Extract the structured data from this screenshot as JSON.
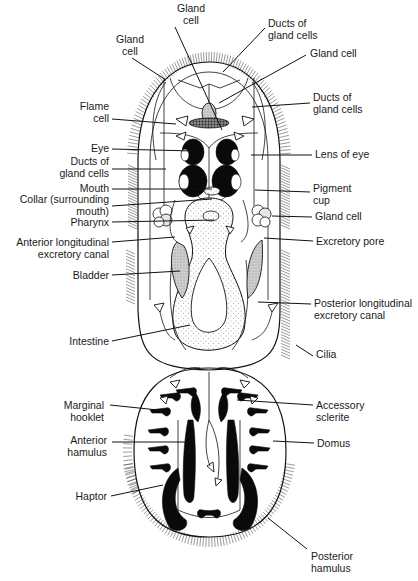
{
  "figure": {
    "colors": {
      "ink": "#111111",
      "background": "#ffffff",
      "stipple": "#555555"
    }
  },
  "labels": {
    "left": [
      {
        "id": "gland-cell-top",
        "lines": [
          "Gland",
          "cell"
        ],
        "x": 191,
        "y": 12,
        "anchor": "middle",
        "leader": [
          [
            175,
            27
          ],
          [
            222,
            130
          ]
        ]
      },
      {
        "id": "gland-cell-upper-left",
        "lines": [
          "Gland",
          "cell"
        ],
        "x": 130,
        "y": 43,
        "anchor": "middle",
        "leader": [
          [
            132,
            58
          ],
          [
            166,
            80
          ]
        ]
      },
      {
        "id": "flame-cell",
        "lines": [
          "Flame",
          "cell"
        ],
        "x": 109,
        "y": 110,
        "anchor": "end",
        "leader": [
          [
            112,
            119
          ],
          [
            176,
            124
          ]
        ]
      },
      {
        "id": "eye",
        "lines": [
          "Eye"
        ],
        "x": 109,
        "y": 152,
        "anchor": "end",
        "leader": [
          [
            112,
            149
          ],
          [
            194,
            151
          ]
        ]
      },
      {
        "id": "ducts-of-gland-cells-left",
        "lines": [
          "Ducts of",
          "gland cells"
        ],
        "x": 109,
        "y": 165,
        "anchor": "end",
        "leader": [
          [
            112,
            169
          ],
          [
            166,
            169
          ]
        ]
      },
      {
        "id": "mouth",
        "lines": [
          "Mouth"
        ],
        "x": 109,
        "y": 192,
        "anchor": "end",
        "leader": [
          [
            112,
            189
          ],
          [
            212,
            189
          ]
        ]
      },
      {
        "id": "collar",
        "lines": [
          "Collar (surrounding",
          "mouth)"
        ],
        "x": 109,
        "y": 203,
        "anchor": "end",
        "leader": [
          [
            112,
            206
          ],
          [
            212,
            199
          ]
        ]
      },
      {
        "id": "pharynx",
        "lines": [
          "Pharynx"
        ],
        "x": 109,
        "y": 226,
        "anchor": "end",
        "leader": [
          [
            112,
            222
          ],
          [
            214,
            220
          ]
        ]
      },
      {
        "id": "anterior-longitudinal-excretory-canal",
        "lines": [
          "Anterior longitudinal",
          "excretory canal"
        ],
        "x": 109,
        "y": 246,
        "anchor": "end",
        "leader": [
          [
            112,
            242
          ],
          [
            175,
            237
          ]
        ]
      },
      {
        "id": "bladder",
        "lines": [
          "Bladder"
        ],
        "x": 109,
        "y": 279,
        "anchor": "end",
        "leader": [
          [
            112,
            275
          ],
          [
            180,
            271
          ]
        ]
      },
      {
        "id": "intestine",
        "lines": [
          "Intestine"
        ],
        "x": 109,
        "y": 345,
        "anchor": "end",
        "leader": [
          [
            112,
            341
          ],
          [
            190,
            325
          ]
        ]
      },
      {
        "id": "marginal-hooklet",
        "lines": [
          "Marginal",
          "hooklet"
        ],
        "x": 104,
        "y": 409,
        "anchor": "end",
        "leader": [
          [
            110,
            405
          ],
          [
            158,
            410
          ]
        ]
      },
      {
        "id": "anterior-hamulus",
        "lines": [
          "Anterior",
          "hamulus"
        ],
        "x": 107,
        "y": 444,
        "anchor": "end",
        "leader": [
          [
            112,
            442
          ],
          [
            193,
            442
          ]
        ]
      },
      {
        "id": "haptor",
        "lines": [
          "Haptor"
        ],
        "x": 107,
        "y": 500,
        "anchor": "end",
        "leader": [
          [
            111,
            496
          ],
          [
            163,
            485
          ]
        ]
      }
    ],
    "right": [
      {
        "id": "ducts-of-gland-cells-top",
        "lines": [
          "Ducts of",
          "gland cells"
        ],
        "x": 268,
        "y": 27,
        "anchor": "start",
        "leader": [
          [
            265,
            28
          ],
          [
            223,
            72
          ]
        ]
      },
      {
        "id": "gland-cell-upper-right",
        "lines": [
          "Gland cell"
        ],
        "x": 310,
        "y": 57,
        "anchor": "start",
        "leader": [
          [
            306,
            55
          ],
          [
            219,
            103
          ]
        ]
      },
      {
        "id": "ducts-of-gland-cells-right",
        "lines": [
          "Ducts of",
          "gland cells"
        ],
        "x": 313,
        "y": 101,
        "anchor": "start",
        "leader": [
          [
            310,
            103
          ],
          [
            252,
            107
          ]
        ]
      },
      {
        "id": "lens-of-eye",
        "lines": [
          "Lens of eye"
        ],
        "x": 315,
        "y": 158,
        "anchor": "start",
        "leader": [
          [
            312,
            155
          ],
          [
            251,
            155
          ]
        ]
      },
      {
        "id": "pigment-cup",
        "lines": [
          "Pigment",
          "cup"
        ],
        "x": 313,
        "y": 192,
        "anchor": "start",
        "leader": [
          [
            310,
            192
          ],
          [
            255,
            190
          ]
        ]
      },
      {
        "id": "gland-cell-right",
        "lines": [
          "Gland cell"
        ],
        "x": 315,
        "y": 220,
        "anchor": "start",
        "leader": [
          [
            312,
            217
          ],
          [
            272,
            216
          ]
        ]
      },
      {
        "id": "excretory-pore",
        "lines": [
          "Excretory pore"
        ],
        "x": 316,
        "y": 245,
        "anchor": "start",
        "leader": [
          [
            313,
            241
          ],
          [
            264,
            238
          ]
        ]
      },
      {
        "id": "posterior-longitudinal-excretory-canal",
        "lines": [
          "Posterior longitudinal",
          "excretory canal"
        ],
        "x": 314,
        "y": 307,
        "anchor": "start",
        "leader": [
          [
            311,
            304
          ],
          [
            258,
            302
          ]
        ]
      },
      {
        "id": "cilia",
        "lines": [
          "Cilia"
        ],
        "x": 316,
        "y": 358,
        "anchor": "start",
        "leader": [
          [
            313,
            356
          ],
          [
            296,
            345
          ]
        ]
      },
      {
        "id": "accessory-sclerite",
        "lines": [
          "Accessory",
          "sclerite"
        ],
        "x": 316,
        "y": 409,
        "anchor": "start",
        "leader": [
          [
            313,
            405
          ],
          [
            237,
            400
          ]
        ]
      },
      {
        "id": "domus",
        "lines": [
          "Domus"
        ],
        "x": 317,
        "y": 447,
        "anchor": "start",
        "leader": [
          [
            314,
            443
          ],
          [
            273,
            441
          ]
        ]
      },
      {
        "id": "posterior-hamulus",
        "lines": [
          "Posterior",
          "hamulus"
        ],
        "x": 311,
        "y": 560,
        "anchor": "start",
        "leader": [
          [
            307,
            549
          ],
          [
            268,
            518
          ]
        ]
      }
    ]
  }
}
